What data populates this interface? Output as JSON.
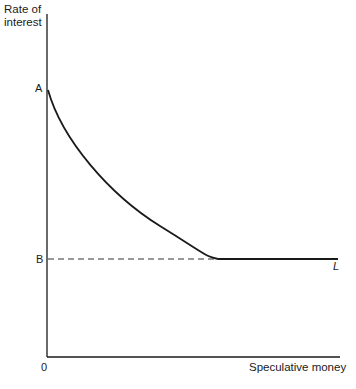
{
  "figure": {
    "y_axis_label_line1": "Rate of",
    "y_axis_label_line2": "interest",
    "x_axis_label": "Speculative money",
    "origin_label": "0",
    "point_a_label": "A",
    "point_b_label": "B",
    "curve_label": "L",
    "colors": {
      "ink": "#1a1a1a",
      "background": "#ffffff"
    }
  },
  "diagram": {
    "type": "liquidity-preference-curve",
    "axes": {
      "y": "Rate of interest",
      "x": "Speculative money"
    },
    "points": {
      "A": "intercept on interest-rate axis (curve start)",
      "B": "minimum interest rate; dashed line from axis to where curve flattens"
    },
    "segments": [
      {
        "name": "downward-sloping convex segment",
        "from": "A",
        "to": "kink at rate B"
      },
      {
        "name": "horizontal segment (liquidity trap)",
        "at": "B",
        "label": "L"
      }
    ]
  }
}
